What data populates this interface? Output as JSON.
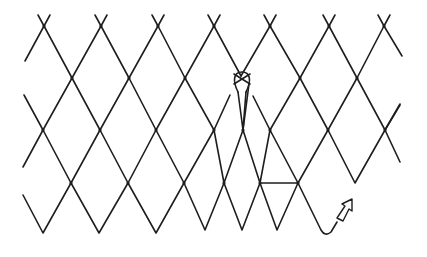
{
  "diagram": {
    "stroke_color": "#1e1e1e",
    "background": "#ffffff",
    "elements": {
      "mesh": "diamond netting mesh",
      "loop": "mesh loop / knot being tied",
      "arrow": "direction-of-work arrow"
    }
  }
}
